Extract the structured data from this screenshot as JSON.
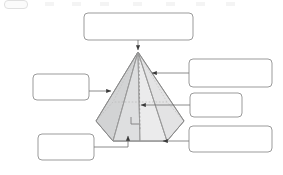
{
  "page": {
    "background_color": "#ffffff",
    "width": 283,
    "height": 175
  },
  "artifact_strip": {
    "description": "faint cut-off toolbar remnant along top edge",
    "visible": true,
    "pill_label": "",
    "tick_count": 7
  },
  "diagram": {
    "name": "hexagonal-pyramid",
    "type": "3d-solid",
    "solid": "hexagonal pyramid",
    "colors": {
      "outline": "#8c8c8c",
      "face_light": "#ececed",
      "face_mid": "#dcdcdd",
      "face_dark": "#cfd0d0",
      "base_fill": "#e4e4e5",
      "hidden_edge": "#b5b5b5",
      "box_border": "#9b9b9b",
      "box_fill": "#ffffff",
      "connector": "#6e6e6e",
      "arrow_head": "#3a3a3a"
    },
    "apex": {
      "x": 138,
      "y": 52
    },
    "base_center": {
      "x": 140,
      "y": 120
    },
    "right_angle_marker": {
      "x": 131,
      "y": 124,
      "size": 7,
      "label": ""
    }
  },
  "labels": [
    {
      "id": "apex-label",
      "name": "label-box-apex",
      "text": "",
      "placeholder": "",
      "box": {
        "x": 84,
        "y": 13,
        "w": 109,
        "h": 27
      },
      "target": {
        "x": 138,
        "y": 52
      },
      "arrow_direction": "down"
    },
    {
      "id": "lateral-face-label",
      "name": "label-box-lateral-face",
      "text": "",
      "placeholder": "",
      "box": {
        "x": 189,
        "y": 59,
        "w": 83,
        "h": 28
      },
      "target": {
        "x": 150,
        "y": 73
      },
      "arrow_direction": "left"
    },
    {
      "id": "height-label",
      "name": "label-box-height",
      "text": "",
      "placeholder": "",
      "box": {
        "x": 190,
        "y": 93,
        "w": 52,
        "h": 24
      },
      "target": {
        "x": 139,
        "y": 105
      },
      "arrow_direction": "left"
    },
    {
      "id": "base-vertex-label",
      "name": "label-box-base-vertex",
      "text": "",
      "placeholder": "",
      "box": {
        "x": 189,
        "y": 126,
        "w": 83,
        "h": 26
      },
      "target": {
        "x": 161,
        "y": 141
      },
      "arrow_direction": "left"
    },
    {
      "id": "slant-edge-label",
      "name": "label-box-slant-edge",
      "text": "",
      "placeholder": "",
      "box": {
        "x": 33,
        "y": 74,
        "w": 56,
        "h": 26
      },
      "target": {
        "x": 113,
        "y": 91
      },
      "arrow_direction": "right"
    },
    {
      "id": "base-edge-label",
      "name": "label-box-base-edge",
      "text": "",
      "placeholder": "",
      "box": {
        "x": 38,
        "y": 134,
        "w": 56,
        "h": 26
      },
      "target": {
        "x": 128,
        "y": 134
      },
      "arrow_direction": "up"
    }
  ]
}
